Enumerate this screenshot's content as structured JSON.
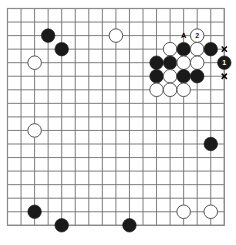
{
  "diagram": {
    "type": "go-board",
    "board": {
      "cols": 17,
      "rows": 17,
      "origin_x": 7.5,
      "origin_y": 8.5,
      "spacing": 13.55,
      "line_color": "#707070",
      "line_width": 0.9,
      "background_color": "#ffffff",
      "border_color": "#8a8a8a"
    },
    "colors": {
      "black_stone": "#1a1a1a",
      "white_stone": "#ffffff",
      "white_stone_edge": "#555555",
      "label_on_black": "#ffffff",
      "label_on_white": "#1a1a1a",
      "mark_color": "#000000",
      "accent": "#707070"
    },
    "stones": [
      {
        "id": "b-upper-left-1",
        "color": "black",
        "col": 3,
        "row": 2,
        "label": ""
      },
      {
        "id": "b-upper-left-2",
        "color": "black",
        "col": 4,
        "row": 3,
        "label": ""
      },
      {
        "id": "w-left-upper",
        "color": "white",
        "col": 2,
        "row": 4,
        "label": ""
      },
      {
        "id": "w-top-center",
        "color": "white",
        "col": 8,
        "row": 2,
        "label": ""
      },
      {
        "id": "w-cl-r1-c12",
        "color": "white",
        "col": 12,
        "row": 3,
        "label": ""
      },
      {
        "id": "b-cl-r1-c13",
        "color": "black",
        "col": 13,
        "row": 3,
        "label": ""
      },
      {
        "id": "w-cl-r1-c14",
        "color": "white",
        "col": 14,
        "row": 3,
        "label": ""
      },
      {
        "id": "b-cl-r1-c15",
        "color": "black",
        "col": 15,
        "row": 3,
        "label": ""
      },
      {
        "id": "w-cl-r0-c14",
        "color": "white",
        "col": 14,
        "row": 2,
        "label": "2"
      },
      {
        "id": "b-cl-r2-c11",
        "color": "black",
        "col": 11,
        "row": 4,
        "label": ""
      },
      {
        "id": "b-cl-r2-c12",
        "color": "black",
        "col": 12,
        "row": 4,
        "label": ""
      },
      {
        "id": "w-cl-r2-c13",
        "color": "white",
        "col": 13,
        "row": 4,
        "label": ""
      },
      {
        "id": "w-cl-r2-c14",
        "color": "white",
        "col": 14,
        "row": 4,
        "label": ""
      },
      {
        "id": "b-cl-r2-c16",
        "color": "black",
        "col": 16,
        "row": 4,
        "label": "1"
      },
      {
        "id": "b-cl-r3-c11",
        "color": "black",
        "col": 11,
        "row": 5,
        "label": ""
      },
      {
        "id": "w-cl-r3-c12",
        "color": "white",
        "col": 12,
        "row": 5,
        "label": ""
      },
      {
        "id": "b-cl-r3-c13",
        "color": "black",
        "col": 13,
        "row": 5,
        "label": ""
      },
      {
        "id": "b-cl-r3-c14",
        "color": "black",
        "col": 14,
        "row": 5,
        "label": ""
      },
      {
        "id": "w-cl-r4-c11",
        "color": "white",
        "col": 11,
        "row": 6,
        "label": ""
      },
      {
        "id": "w-cl-r4-c12",
        "color": "white",
        "col": 12,
        "row": 6,
        "label": ""
      },
      {
        "id": "w-cl-r4-c13",
        "color": "white",
        "col": 13,
        "row": 6,
        "label": ""
      },
      {
        "id": "w-left-mid",
        "color": "white",
        "col": 2,
        "row": 9,
        "label": ""
      },
      {
        "id": "b-right-mid",
        "color": "black",
        "col": 15,
        "row": 10,
        "label": ""
      },
      {
        "id": "b-bottom-left-1",
        "color": "black",
        "col": 2,
        "row": 15,
        "label": ""
      },
      {
        "id": "b-bottom-left-2",
        "color": "black",
        "col": 4,
        "row": 16,
        "label": ""
      },
      {
        "id": "b-bottom-center",
        "color": "black",
        "col": 9,
        "row": 16,
        "label": ""
      },
      {
        "id": "w-bottom-r-1",
        "color": "white",
        "col": 13,
        "row": 15,
        "label": ""
      },
      {
        "id": "w-bottom-r-2",
        "color": "white",
        "col": 15,
        "row": 15,
        "label": ""
      }
    ],
    "markers": [
      {
        "id": "mark-A",
        "kind": "letter",
        "text": "A",
        "col": 13,
        "row": 2
      },
      {
        "id": "mark-x1",
        "kind": "cross",
        "text": "x",
        "col": 16,
        "row": 3
      },
      {
        "id": "mark-x2",
        "kind": "cross",
        "text": "x",
        "col": 16,
        "row": 5
      }
    ],
    "move_labels": {
      "black_move": "1",
      "white_move": "2",
      "point_of_interest": "A"
    }
  }
}
